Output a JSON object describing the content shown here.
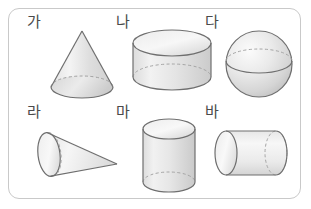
{
  "worksheet": {
    "title": "Geometric solids figure set",
    "border_color": "#c9c9c9",
    "background_color": "#ffffff",
    "stroke_color": "#7a7a7a",
    "dashed_stroke_color": "#a8a8a8",
    "label_color": "#4a4a4a"
  },
  "items": [
    {
      "label": "가",
      "shape": "cone",
      "shape_name": "cone-upright",
      "orientation": "apex-up",
      "label_x": 26,
      "label_y": 14,
      "fig_x": 35,
      "fig_y": 22
    },
    {
      "label": "나",
      "shape": "cylinder",
      "shape_name": "cylinder-flat-wide",
      "orientation": "vertical-short",
      "label_x": 115,
      "label_y": 14,
      "fig_x": 128,
      "fig_y": 22
    },
    {
      "label": "다",
      "shape": "sphere",
      "shape_name": "sphere",
      "orientation": "none",
      "label_x": 205,
      "label_y": 14,
      "fig_x": 217,
      "fig_y": 22
    },
    {
      "label": "라",
      "shape": "cone",
      "shape_name": "cone-sideways",
      "orientation": "apex-right",
      "label_x": 26,
      "label_y": 104,
      "fig_x": 33,
      "fig_y": 112
    },
    {
      "label": "마",
      "shape": "cylinder",
      "shape_name": "cylinder-tall",
      "orientation": "vertical-tall",
      "label_x": 115,
      "label_y": 104,
      "fig_x": 128,
      "fig_y": 112
    },
    {
      "label": "바",
      "shape": "cylinder",
      "shape_name": "cylinder-horizontal",
      "orientation": "horizontal",
      "label_x": 205,
      "label_y": 104,
      "fig_x": 215,
      "fig_y": 112
    }
  ]
}
